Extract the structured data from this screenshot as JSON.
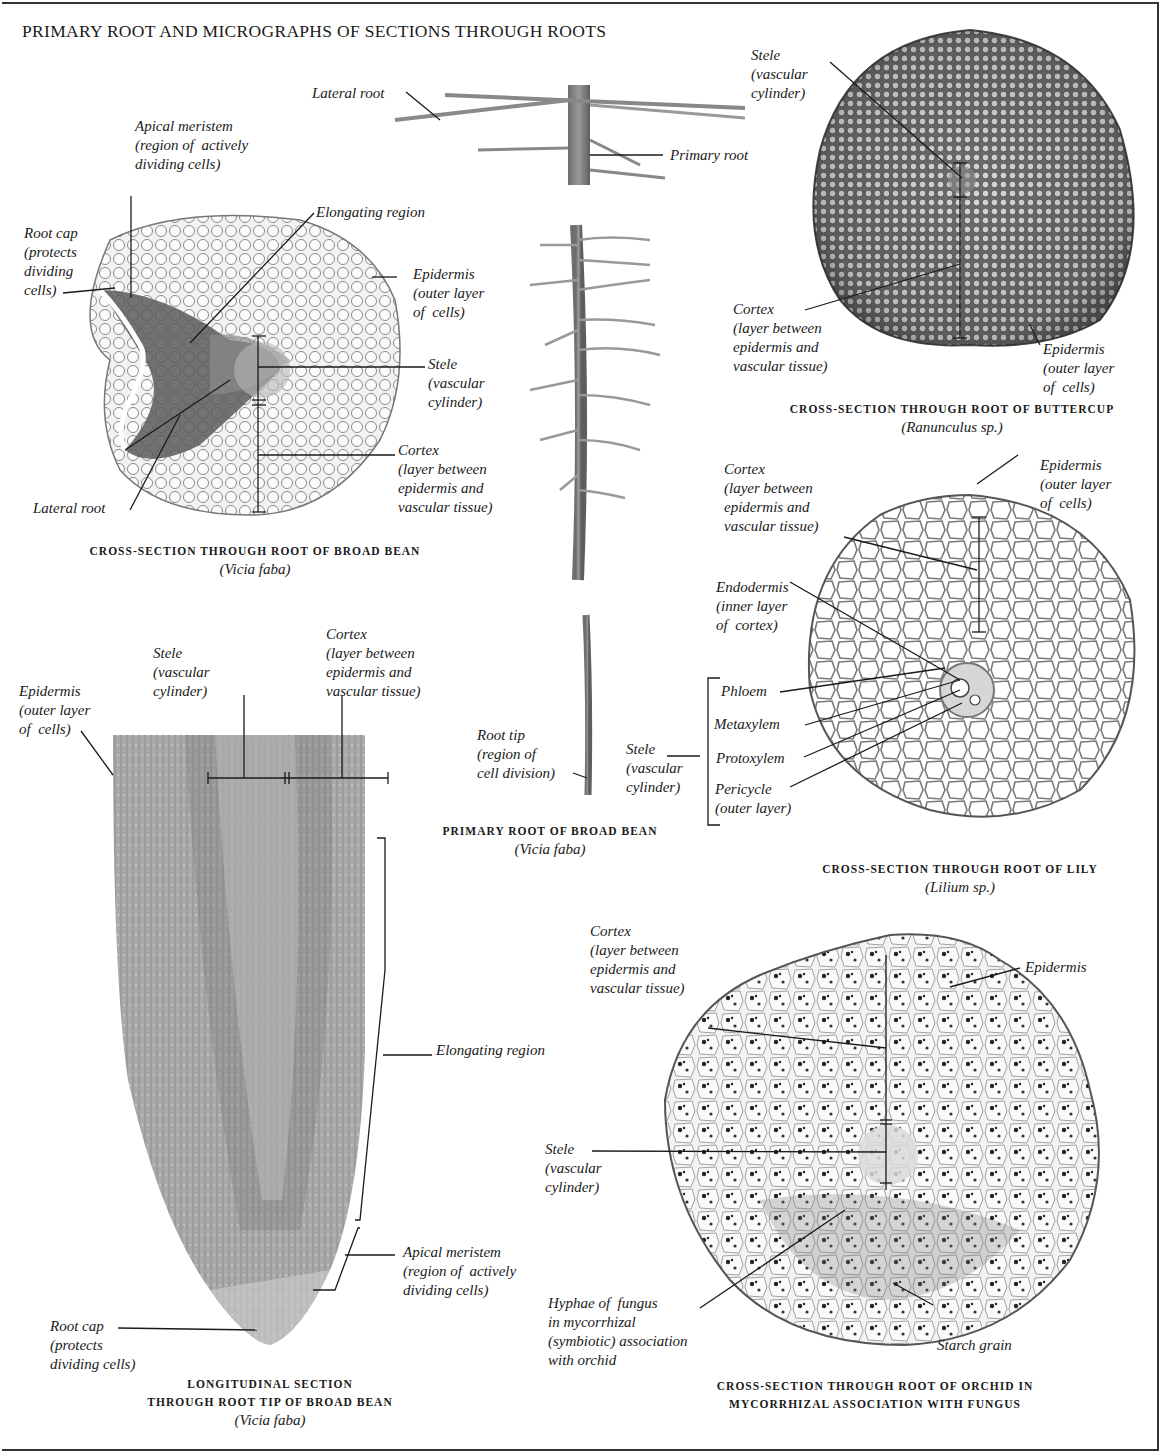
{
  "title": "PRIMARY ROOT AND MICROGRAPHS OF SECTIONS THROUGH ROOTS",
  "figures": {
    "broad_bean_cross": {
      "caption": "CROSS-SECTION THROUGH ROOT OF BROAD BEAN",
      "species": "(Vicia faba)",
      "labels": {
        "apical_meristem": "Apical meristem\n(region of  actively\ndividing cells)",
        "elongating_region": "Elongating region",
        "root_cap": "Root cap\n(protects\ndividing\ncells)",
        "epidermis": "Epidermis\n(outer layer\nof  cells)",
        "stele": "Stele\n(vascular\ncylinder)",
        "cortex": "Cortex\n(layer between\nepidermis and\nvascular tissue)",
        "lateral_root": "Lateral root"
      }
    },
    "primary_root": {
      "caption": "PRIMARY ROOT OF BROAD BEAN",
      "species": "(Vicia faba)",
      "labels": {
        "lateral_root": "Lateral root",
        "primary_root": "Primary root",
        "root_tip": "Root tip\n(region of\ncell division)"
      }
    },
    "buttercup_cross": {
      "caption": "CROSS-SECTION THROUGH ROOT OF BUTTERCUP",
      "species": "(Ranunculus sp.)",
      "labels": {
        "stele": "Stele\n(vascular\ncylinder)",
        "cortex": "Cortex\n(layer between\nepidermis and\nvascular tissue)",
        "epidermis": "Epidermis\n(outer layer\nof  cells)"
      }
    },
    "lily_cross": {
      "caption": "CROSS-SECTION THROUGH ROOT OF LILY",
      "species": "(Lilium sp.)",
      "labels": {
        "cortex": "Cortex\n(layer between\nepidermis and\nvascular tissue)",
        "epidermis": "Epidermis\n(outer layer\nof  cells)",
        "endodermis": "Endodermis\n(inner layer\nof  cortex)",
        "stele": "Stele\n(vascular\ncylinder)",
        "phloem": "Phloem",
        "metaxylem": "Metaxylem",
        "protoxylem": "Protoxylem",
        "pericycle": "Pericycle\n(outer layer)"
      }
    },
    "longitudinal": {
      "caption_line1": "LONGITUDINAL SECTION",
      "caption_line2": "THROUGH ROOT TIP OF BROAD BEAN",
      "species": "(Vicia faba)",
      "labels": {
        "epidermis": "Epidermis\n(outer layer\nof  cells)",
        "stele": "Stele\n(vascular\ncylinder)",
        "cortex": "Cortex\n(layer between\nepidermis and\nvascular tissue)",
        "elongating_region": "Elongating region",
        "apical_meristem": "Apical meristem\n(region of  actively\ndividing cells)",
        "root_cap": "Root cap\n(protects\ndividing cells)"
      }
    },
    "orchid_cross": {
      "caption_line1": "CROSS-SECTION THROUGH ROOT OF ORCHID IN",
      "caption_line2": "MYCORRHIZAL ASSOCIATION WITH FUNGUS",
      "labels": {
        "cortex": "Cortex\n(layer between\nepidermis and\nvascular tissue)",
        "epidermis": "Epidermis",
        "stele": "Stele\n(vascular\ncylinder)",
        "hyphae": "Hyphae of  fungus\nin mycorrhizal\n(symbiotic) association\nwith orchid",
        "starch_grain": "Starch grain"
      }
    }
  }
}
